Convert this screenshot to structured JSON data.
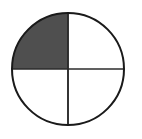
{
  "figure": {
    "name": "fraction-circle",
    "title": "Circle divided into four equal quadrants with one quadrant shaded",
    "background_color": "#ffffff",
    "outline_color": "#1a1a1a",
    "divider_color": "#2b2b2b",
    "shaded_color": "#4f4f4f",
    "unshaded_color": "#ffffff",
    "center_x": 68,
    "center_y": 69,
    "radius": 57,
    "outline_width": 2,
    "divider_width": 1.6
  },
  "chart_data": {
    "type": "pie",
    "title": "",
    "subtitle": "",
    "xlabel": "",
    "ylabel": "",
    "categories": [
      "Top-left quadrant",
      "Top-right quadrant",
      "Bottom-right quadrant",
      "Bottom-left quadrant"
    ],
    "values": [
      25,
      25,
      25,
      25
    ],
    "fraction_shaded": "1/4",
    "shaded_count": 1,
    "total_parts": 4,
    "slices": [
      {
        "name": "top-left-quadrant",
        "label": "Top-left quadrant",
        "value": 25,
        "start_angle_deg": 180,
        "end_angle_deg": 270,
        "shaded": true,
        "fill": "#4f4f4f"
      },
      {
        "name": "top-right-quadrant",
        "label": "Top-right quadrant",
        "value": 25,
        "start_angle_deg": 270,
        "end_angle_deg": 360,
        "shaded": false,
        "fill": "#ffffff"
      },
      {
        "name": "bottom-right-quadrant",
        "label": "Bottom-right quadrant",
        "value": 25,
        "start_angle_deg": 0,
        "end_angle_deg": 90,
        "shaded": false,
        "fill": "#ffffff"
      },
      {
        "name": "bottom-left-quadrant",
        "label": "Bottom-left quadrant",
        "value": 25,
        "start_angle_deg": 90,
        "end_angle_deg": 180,
        "shaded": false,
        "fill": "#ffffff"
      }
    ],
    "legend": [],
    "legend_position": "none",
    "grid": false,
    "annotations": []
  }
}
